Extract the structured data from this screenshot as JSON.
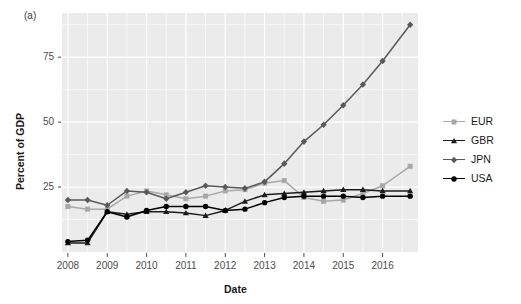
{
  "figure": {
    "panel_label": "(a)",
    "ylabel": "Percent of GDP",
    "xlabel": "Date",
    "panel_bg": "#ebebeb",
    "grid_color": "#ffffff"
  },
  "legend": {
    "position": "right",
    "entries": [
      {
        "label": "EUR",
        "color": "#a8a8a8",
        "marker": "square"
      },
      {
        "label": "GBR",
        "color": "#1c1c1c",
        "marker": "triangle"
      },
      {
        "label": "JPN",
        "color": "#595959",
        "marker": "diamond"
      },
      {
        "label": "USA",
        "color": "#000000",
        "marker": "circle"
      }
    ]
  },
  "axes": {
    "y_ticks": [
      "25",
      "50",
      "75"
    ],
    "y_tick_values": [
      25,
      50,
      75
    ],
    "x_ticks": [
      "2008",
      "2009",
      "2010",
      "2011",
      "2012",
      "2013",
      "2014",
      "2015",
      "2016"
    ],
    "x_tick_values": [
      2008,
      2009,
      2010,
      2011,
      2012,
      2013,
      2014,
      2015,
      2016
    ],
    "xlim": [
      2007.85,
      2016.9
    ],
    "ylim": [
      0,
      92
    ],
    "grid": true
  },
  "chart_data": {
    "type": "line",
    "title": "",
    "subtitle": "",
    "xlabel": "Date",
    "ylabel": "Percent of GDP",
    "xlim": [
      2007.85,
      2016.9
    ],
    "ylim": [
      0,
      92
    ],
    "grid": true,
    "legend_position": "right",
    "annotations": [
      "(a)"
    ],
    "x": [
      2008.0,
      2008.5,
      2009.0,
      2009.5,
      2010.0,
      2010.5,
      2011.0,
      2011.5,
      2012.0,
      2012.5,
      2013.0,
      2013.5,
      2014.0,
      2014.5,
      2015.0,
      2015.5,
      2016.0,
      2016.7
    ],
    "series": [
      {
        "name": "EUR",
        "color": "#a8a8a8",
        "marker": "square",
        "values": [
          17.5,
          16.5,
          16.5,
          21.5,
          23.5,
          22.0,
          20.5,
          21.5,
          23.5,
          24.0,
          26.5,
          27.5,
          21.0,
          19.5,
          20.0,
          22.5,
          25.5,
          33.0
        ]
      },
      {
        "name": "GBR",
        "color": "#1c1c1c",
        "marker": "triangle",
        "values": [
          3.5,
          3.5,
          15.5,
          14.5,
          15.5,
          15.5,
          15.0,
          14.0,
          16.0,
          19.5,
          22.0,
          22.5,
          23.0,
          23.5,
          24.0,
          24.0,
          23.5,
          23.5
        ]
      },
      {
        "name": "JPN",
        "color": "#595959",
        "marker": "diamond",
        "values": [
          20.0,
          20.0,
          18.0,
          23.5,
          23.0,
          20.5,
          23.0,
          25.5,
          25.0,
          24.5,
          27.0,
          34.0,
          42.5,
          49.0,
          56.5,
          64.5,
          73.5,
          87.5
        ]
      },
      {
        "name": "USA",
        "color": "#000000",
        "marker": "circle",
        "values": [
          4.0,
          4.5,
          15.5,
          13.5,
          16.0,
          17.5,
          17.5,
          17.5,
          16.0,
          16.5,
          19.0,
          21.0,
          21.5,
          21.5,
          21.5,
          21.0,
          21.5,
          21.5
        ]
      }
    ]
  }
}
